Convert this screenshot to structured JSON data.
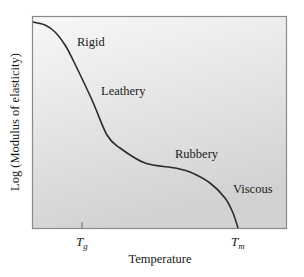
{
  "chart_data": {
    "type": "line",
    "title": "",
    "xlabel": "Temperature",
    "ylabel": "Log (Modulus of elasticity)",
    "x_ticks": [
      {
        "label": "T",
        "sub": "g"
      },
      {
        "label": "T",
        "sub": "m"
      }
    ],
    "regions": [
      "Rigid",
      "Leathery",
      "Rubbery",
      "Viscous"
    ],
    "series": [
      {
        "name": "Modulus vs Temperature",
        "description": "Modulus high and flat (Rigid), drops steeply through Leathery region near Tg, plateaus (Rubbery), then drops to zero at Tm (Viscous)",
        "points_px": [
          [
            33,
            22
          ],
          [
            45,
            25
          ],
          [
            55,
            32
          ],
          [
            65,
            45
          ],
          [
            73,
            60
          ],
          [
            92,
            100
          ],
          [
            107,
            135
          ],
          [
            120,
            148
          ],
          [
            145,
            163
          ],
          [
            175,
            168
          ],
          [
            190,
            172
          ],
          [
            210,
            183
          ],
          [
            225,
            198
          ],
          [
            233,
            213
          ],
          [
            238,
            228
          ]
        ]
      }
    ],
    "grid": false,
    "legend": "none",
    "colors": {
      "background_top": "#f7f7f7",
      "background_bottom": "#d4d4d4",
      "curve": "#2b2b2b",
      "frame": "#8a8a8a"
    }
  }
}
